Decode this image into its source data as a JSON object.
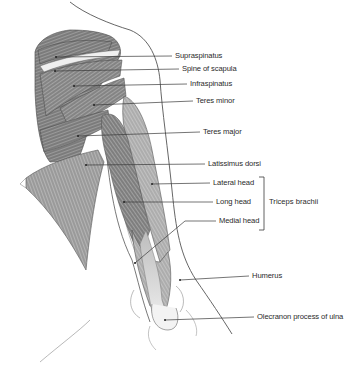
{
  "diagram": {
    "type": "anatomical-illustration",
    "labels": [
      {
        "text": "Supraspinatus",
        "x": 175,
        "y": 56,
        "dot": [
          56,
          57
        ]
      },
      {
        "text": "Spine of scapula",
        "x": 182,
        "y": 69,
        "dot": [
          55,
          71
        ]
      },
      {
        "text": "Infraspinatus",
        "x": 190,
        "y": 84,
        "dot": [
          74,
          86
        ]
      },
      {
        "text": "Teres minor",
        "x": 196,
        "y": 101,
        "dot": [
          94,
          105
        ]
      },
      {
        "text": "Teres major",
        "x": 203,
        "y": 132,
        "dot": [
          78,
          136
        ]
      },
      {
        "text": "Latissimus dorsi",
        "x": 208,
        "y": 164,
        "dot": [
          86,
          165
        ]
      },
      {
        "text": "Lateral head",
        "x": 213,
        "y": 183,
        "dot": [
          152,
          184
        ]
      },
      {
        "text": "Long head",
        "x": 216,
        "y": 202,
        "dot": [
          124,
          202
        ]
      },
      {
        "text": "Medial head",
        "x": 219,
        "y": 221,
        "dot": [
          135,
          263
        ]
      },
      {
        "text": "Humerus",
        "x": 252,
        "y": 276,
        "dot": [
          180,
          280
        ]
      },
      {
        "text": "Olecranon process of ulna",
        "x": 257,
        "y": 317,
        "dot": [
          165,
          320
        ]
      }
    ],
    "group_bracket": {
      "text": "Triceps brachii",
      "x": 269,
      "y": 202,
      "bracket_top": 177,
      "bracket_bottom": 230,
      "bracket_x": 264
    }
  },
  "colors": {
    "background": "#ffffff",
    "text": "#2a2a2a",
    "leader": "#3a3a3a",
    "outline": "#4a4a4a",
    "muscle_dark": "#6e6e6e",
    "muscle_mid": "#a8a8a8",
    "muscle_light": "#d6d6d6"
  }
}
